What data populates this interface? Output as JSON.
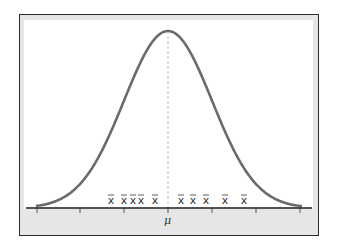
{
  "chart_data": {
    "type": "line",
    "title": "",
    "xlabel": "",
    "ylabel": "",
    "x_tick_labels": [
      "",
      "",
      "",
      "μ",
      "",
      "",
      ""
    ],
    "mean_label": "μ",
    "sample_mean_label": "x̄",
    "sample_means_count": 10,
    "sample_means_relative_positions": [
      -2.6,
      -2.0,
      -1.6,
      -1.3,
      -0.6,
      0.55,
      1.1,
      1.7,
      2.55,
      3.4
    ],
    "curve_color": "#6b6b6b",
    "mean_line_style": "dashed",
    "grid": false,
    "legend": null
  },
  "labels": {
    "mu": "μ",
    "xbar": "x̄"
  }
}
